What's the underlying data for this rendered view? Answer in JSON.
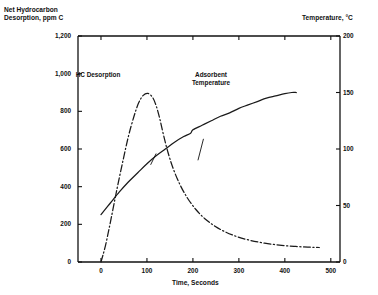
{
  "chart_data": {
    "type": "line",
    "title": "",
    "xlabel": "Time, Seconds",
    "ylabel": "Net Hydrocarbon\nDesorption, ppm C",
    "y2label": "Temperature, °C",
    "xlim": [
      -50,
      520
    ],
    "ylim": [
      0,
      1200
    ],
    "y2lim": [
      0,
      200
    ],
    "xticks": [
      "0",
      "100",
      "200",
      "300",
      "400",
      "500"
    ],
    "xtick_values": [
      0,
      100,
      200,
      300,
      400,
      500
    ],
    "yticks": [
      "0",
      "200",
      "400",
      "600",
      "800",
      "1,000",
      "1,200"
    ],
    "ytick_values": [
      0,
      200,
      400,
      600,
      800,
      1000,
      1200
    ],
    "y2ticks": [
      "0",
      "50",
      "100",
      "150",
      "200"
    ],
    "y2tick_values": [
      0,
      50,
      100,
      150,
      200
    ],
    "grid": false,
    "legend_position": "inline-annotations",
    "series": [
      {
        "name": "HC Desorption",
        "axis": "left",
        "style": "dash-dot",
        "color": "#1a1a1a",
        "points": [
          [
            0,
            0
          ],
          [
            10,
            90
          ],
          [
            22,
            230
          ],
          [
            35,
            390
          ],
          [
            48,
            540
          ],
          [
            60,
            670
          ],
          [
            72,
            775
          ],
          [
            82,
            845
          ],
          [
            92,
            885
          ],
          [
            102,
            895
          ],
          [
            112,
            875
          ],
          [
            120,
            830
          ],
          [
            128,
            760
          ],
          [
            136,
            675
          ],
          [
            146,
            580
          ],
          [
            158,
            490
          ],
          [
            172,
            410
          ],
          [
            188,
            340
          ],
          [
            206,
            280
          ],
          [
            226,
            230
          ],
          [
            248,
            190
          ],
          [
            272,
            158
          ],
          [
            298,
            133
          ],
          [
            326,
            114
          ],
          [
            356,
            100
          ],
          [
            388,
            90
          ],
          [
            420,
            83
          ],
          [
            450,
            79
          ],
          [
            475,
            77
          ]
        ]
      },
      {
        "name": "Adsorbent Temperature",
        "axis": "right",
        "style": "solid",
        "color": "#1a1a1a",
        "points": [
          [
            0,
            42
          ],
          [
            20,
            52
          ],
          [
            40,
            62
          ],
          [
            60,
            71
          ],
          [
            80,
            79
          ],
          [
            100,
            87
          ],
          [
            120,
            94
          ],
          [
            140,
            100
          ],
          [
            160,
            106
          ],
          [
            180,
            111
          ],
          [
            195,
            114
          ],
          [
            200,
            117
          ],
          [
            220,
            121
          ],
          [
            240,
            125
          ],
          [
            260,
            129
          ],
          [
            280,
            132
          ],
          [
            300,
            136
          ],
          [
            320,
            139
          ],
          [
            340,
            142
          ],
          [
            360,
            145
          ],
          [
            380,
            147
          ],
          [
            400,
            149
          ],
          [
            415,
            150
          ],
          [
            425,
            150
          ]
        ]
      }
    ],
    "annotations": [
      {
        "id": "hc-desorption",
        "text": "HC Desorption",
        "label_x": 98,
        "label_y": 76,
        "leader_from": [
          108,
          86
        ],
        "leader_to": [
          120,
          96
        ]
      },
      {
        "id": "adsorbent-temperature",
        "text": "Adsorbent\nTemperature",
        "label_x": 211,
        "label_y": 79,
        "leader_from": [
          211,
          90
        ],
        "leader_to": [
          223,
          109
        ]
      }
    ]
  },
  "axes": {
    "left_title_line1": "Net Hydrocarbon",
    "left_title_line2": "Desorption, ppm C",
    "right_title": "Temperature, °C",
    "x_title": "Time, Seconds"
  }
}
